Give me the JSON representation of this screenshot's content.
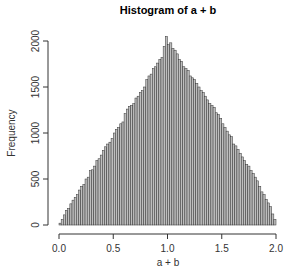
{
  "chart_data": {
    "type": "bar",
    "title": "Histogram of a + b",
    "xlabel": "a + b",
    "ylabel": "Frequency",
    "xlim": [
      0,
      2
    ],
    "ylim": [
      0,
      2000
    ],
    "bin_width": 0.02,
    "x_ticks": [
      "0.0",
      "0.5",
      "1.0",
      "1.5",
      "2.0"
    ],
    "y_ticks": [
      "0",
      "500",
      "1000",
      "1500",
      "2000"
    ],
    "grid": false,
    "legend": null,
    "bar_fill": "#bebebe",
    "bar_edge": "#333333",
    "bin_starts": [
      0.0,
      0.02,
      0.04,
      0.06,
      0.08,
      0.1,
      0.12,
      0.14,
      0.16,
      0.18,
      0.2,
      0.22,
      0.24,
      0.26,
      0.28,
      0.3,
      0.32,
      0.34,
      0.36,
      0.38,
      0.4,
      0.42,
      0.44,
      0.46,
      0.48,
      0.5,
      0.52,
      0.54,
      0.56,
      0.58,
      0.6,
      0.62,
      0.64,
      0.66,
      0.68,
      0.7,
      0.72,
      0.74,
      0.76,
      0.78,
      0.8,
      0.82,
      0.84,
      0.86,
      0.88,
      0.9,
      0.92,
      0.94,
      0.96,
      0.98,
      1.0,
      1.02,
      1.04,
      1.06,
      1.08,
      1.1,
      1.12,
      1.14,
      1.16,
      1.18,
      1.2,
      1.22,
      1.24,
      1.26,
      1.28,
      1.3,
      1.32,
      1.34,
      1.36,
      1.38,
      1.4,
      1.42,
      1.44,
      1.46,
      1.48,
      1.5,
      1.52,
      1.54,
      1.56,
      1.58,
      1.6,
      1.62,
      1.64,
      1.66,
      1.68,
      1.7,
      1.72,
      1.74,
      1.76,
      1.78,
      1.8,
      1.82,
      1.84,
      1.86,
      1.88,
      1.9,
      1.92,
      1.94,
      1.96,
      1.98
    ],
    "values": [
      20,
      60,
      110,
      160,
      180,
      230,
      270,
      300,
      330,
      380,
      420,
      440,
      500,
      520,
      590,
      600,
      640,
      700,
      720,
      760,
      810,
      850,
      880,
      900,
      940,
      1000,
      1040,
      1060,
      1100,
      1120,
      1210,
      1260,
      1290,
      1300,
      1320,
      1380,
      1400,
      1440,
      1460,
      1500,
      1580,
      1620,
      1640,
      1700,
      1720,
      1760,
      1800,
      1820,
      1940,
      2050,
      1960,
      1980,
      1920,
      1900,
      1860,
      1800,
      1780,
      1720,
      1700,
      1680,
      1620,
      1600,
      1580,
      1540,
      1500,
      1460,
      1440,
      1400,
      1360,
      1320,
      1300,
      1280,
      1220,
      1200,
      1160,
      1100,
      1060,
      1020,
      980,
      960,
      880,
      860,
      820,
      780,
      740,
      700,
      660,
      640,
      590,
      560,
      520,
      480,
      420,
      360,
      330,
      280,
      240,
      200,
      120,
      60
    ]
  }
}
